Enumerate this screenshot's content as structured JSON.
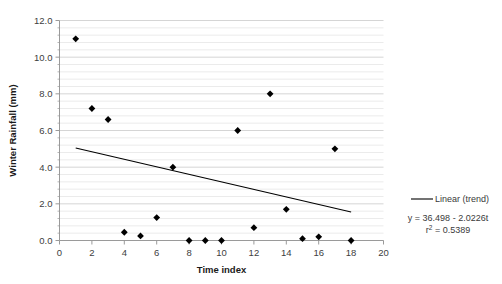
{
  "chart_data": {
    "type": "scatter",
    "title": "",
    "xlabel": "Time index",
    "ylabel": "Winter Rainfall (mm)",
    "xlim": [
      0,
      20
    ],
    "ylim": [
      0.0,
      12.0
    ],
    "xticks": [
      "0",
      "2",
      "4",
      "6",
      "8",
      "10",
      "12",
      "14",
      "16",
      "18",
      "20"
    ],
    "xtick_values": [
      0,
      2,
      4,
      6,
      8,
      10,
      12,
      14,
      16,
      18,
      20
    ],
    "yticks": [
      "0.0",
      "2.0",
      "4.0",
      "6.0",
      "8.0",
      "10.0",
      "12.0"
    ],
    "ytick_values": [
      0,
      2,
      4,
      6,
      8,
      10,
      12
    ],
    "grid": "horizontal-minor",
    "minor_y_step": 0.4,
    "legend_position": "right",
    "marker": "diamond",
    "marker_color": "#000000",
    "series": [
      {
        "name": "Winter Rainfall",
        "x": [
          1,
          2,
          3,
          4,
          5,
          6,
          7,
          8,
          9,
          10,
          11,
          12,
          13,
          14,
          15,
          16,
          17,
          18
        ],
        "values": [
          11.0,
          7.2,
          6.6,
          0.45,
          0.25,
          1.25,
          4.0,
          0.0,
          0.0,
          0.0,
          6.0,
          0.7,
          8.0,
          1.7,
          0.1,
          0.2,
          5.0,
          0.0
        ]
      }
    ],
    "trend": {
      "label": "Linear (trend)",
      "equation": "y = 36.498 - 2.0226t",
      "r_squared_label": "r",
      "r_squared_sup": "2",
      "r_squared_value": " = 0.5389",
      "slope": -2.0226,
      "intercept": 36.498,
      "r_squared": 0.5389,
      "x_start": 1,
      "x_end": 18,
      "color": "#000000"
    },
    "colors": {
      "marker": "#000000",
      "trendline": "#000000",
      "gridline": "#e2e2e2",
      "axis": "#9a9a9a",
      "background": "#ffffff"
    }
  }
}
